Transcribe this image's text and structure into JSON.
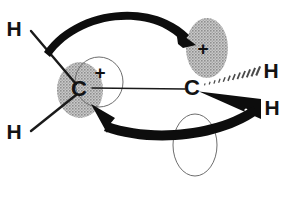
{
  "diagram": {
    "type": "chemical-structure",
    "canvas": {
      "width": 293,
      "height": 198,
      "background": "#ffffff"
    },
    "colors": {
      "ink": "#131313",
      "orbital_fill": "#9a9a9a",
      "orbital_outline": "#6d6d6d",
      "arrow": "#0d0d0d"
    },
    "atoms": [
      {
        "id": "h-upper-left",
        "label": "H",
        "x": 14,
        "y": 36,
        "font_size": 21
      },
      {
        "id": "h-lower-left",
        "label": "H",
        "x": 14,
        "y": 139,
        "font_size": 21
      },
      {
        "id": "carbon-left",
        "label": "C",
        "x": 79,
        "y": 96,
        "font_size": 22
      },
      {
        "id": "carbon-right",
        "label": "C",
        "x": 192,
        "y": 95,
        "font_size": 22
      },
      {
        "id": "h-upper-right",
        "label": "H",
        "x": 271,
        "y": 78,
        "font_size": 21
      },
      {
        "id": "h-lower-right",
        "label": "H",
        "x": 272,
        "y": 115,
        "font_size": 21
      }
    ],
    "charges": [
      {
        "id": "plus-left-carbon",
        "label": "+",
        "x": 100,
        "y": 79,
        "font_size": 19
      },
      {
        "id": "plus-right-orbital",
        "label": "+",
        "x": 203,
        "y": 55,
        "font_size": 19
      }
    ],
    "orbitals": [
      {
        "id": "orbital-filled-left",
        "style": "shaded",
        "cx": 80,
        "cy": 90,
        "rx": 23,
        "ry": 28,
        "rotate": 0,
        "description": "shaded p-orbital lobe on left carbon"
      },
      {
        "id": "orbital-filled-upper-right",
        "style": "shaded",
        "cx": 207,
        "cy": 48,
        "rx": 21,
        "ry": 30,
        "rotate": 0,
        "description": "empty p-orbital lobe receiving electrons"
      },
      {
        "id": "orbital-outline-left",
        "style": "outline",
        "cx": 99,
        "cy": 82,
        "rx": 24,
        "ry": 25,
        "rotate": 0,
        "description": "thin circle around left carbon"
      },
      {
        "id": "orbital-outline-bottom",
        "style": "outline",
        "cx": 195,
        "cy": 145,
        "rx": 22,
        "ry": 31,
        "rotate": 0,
        "description": "thin outlined lobe at lower centre"
      }
    ],
    "bonds": [
      {
        "id": "bond-h-upper-left",
        "kind": "plain",
        "x1": 31,
        "y1": 31,
        "x2": 76,
        "y2": 84,
        "width": 2.4
      },
      {
        "id": "bond-h-lower-left",
        "kind": "plain",
        "x1": 31,
        "y1": 131,
        "x2": 76,
        "y2": 95,
        "width": 2.4
      },
      {
        "id": "bond-carbon-carbon",
        "kind": "plain",
        "x1": 92,
        "y1": 88,
        "x2": 185,
        "y2": 89,
        "width": 1.4
      },
      {
        "id": "bond-h-upper-right",
        "kind": "hashed",
        "x1": 201,
        "y1": 86,
        "x2": 263,
        "y2": 70,
        "marks": 13
      },
      {
        "id": "bond-h-lower-right",
        "kind": "wedge",
        "x1": 200,
        "y1": 93,
        "x2": 262,
        "y2": 108
      }
    ],
    "arrows": [
      {
        "id": "arrow-top-electron-flow",
        "description": "curved arrow from upper C-H bond to empty p-orbital",
        "from": "bond-h-upper-left",
        "to": "orbital-filled-upper-right"
      },
      {
        "id": "arrow-bottom-electron-flow",
        "description": "curved arrow from lower right C-H bond back to left carbon",
        "from": "bond-h-lower-right",
        "to": "carbon-left"
      }
    ]
  }
}
